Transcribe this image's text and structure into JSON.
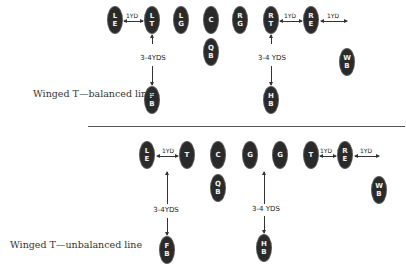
{
  "formations": [
    {
      "caption": "Winged T—balanced line",
      "players": [
        {
          "id": "LE",
          "l1": "L",
          "l2": "E"
        },
        {
          "id": "LT",
          "l1": "L",
          "l2": "T"
        },
        {
          "id": "LG",
          "l1": "L",
          "l2": "G"
        },
        {
          "id": "C",
          "l1": "C",
          "l2": ""
        },
        {
          "id": "RG",
          "l1": "R",
          "l2": "G"
        },
        {
          "id": "RT",
          "l1": "R",
          "l2": "T"
        },
        {
          "id": "RE",
          "l1": "R",
          "l2": "E"
        },
        {
          "id": "QB",
          "l1": "Q",
          "l2": "B"
        },
        {
          "id": "FB",
          "l1": "F",
          "l2": "B"
        },
        {
          "id": "HB",
          "l1": "H",
          "l2": "B"
        },
        {
          "id": "WB",
          "l1": "W",
          "l2": "B"
        }
      ],
      "spacing_labels": {
        "le_lt": "1YD",
        "rt_re": "1YD",
        "re_out": "1YD"
      },
      "depth_labels": {
        "fb": "3-4YDS",
        "hb": "3-4 YDS"
      }
    },
    {
      "caption": "Winged T—unbalanced line",
      "players": [
        {
          "id": "LE",
          "l1": "L",
          "l2": "E"
        },
        {
          "id": "T1",
          "l1": "T",
          "l2": ""
        },
        {
          "id": "C",
          "l1": "C",
          "l2": ""
        },
        {
          "id": "G1",
          "l1": "G",
          "l2": ""
        },
        {
          "id": "G2",
          "l1": "G",
          "l2": ""
        },
        {
          "id": "T2",
          "l1": "T",
          "l2": ""
        },
        {
          "id": "RE",
          "l1": "R",
          "l2": "E"
        },
        {
          "id": "QB",
          "l1": "Q",
          "l2": "B"
        },
        {
          "id": "FB",
          "l1": "F",
          "l2": "B"
        },
        {
          "id": "HB",
          "l1": "H",
          "l2": "B"
        },
        {
          "id": "WB",
          "l1": "W",
          "l2": "B"
        }
      ],
      "spacing_labels": {
        "le_t": "1YD",
        "t_re": "1YD",
        "re_out": "1YD"
      },
      "depth_labels": {
        "fb": "3-4YDS",
        "hb": "3-4 YDS"
      }
    }
  ]
}
